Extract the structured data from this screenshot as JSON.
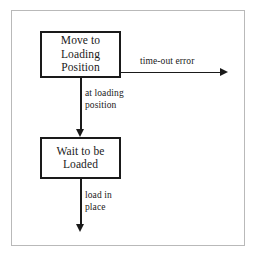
{
  "diagram": {
    "background_color": "#ffffff",
    "frame_color": "#b9b9b9",
    "stroke_color": "#1a1a1a",
    "nodes": [
      {
        "id": "move-to-loading-position",
        "label": "Move to\nLoading\nPosition"
      },
      {
        "id": "wait-to-be-loaded",
        "label": "Wait to be\nLoaded"
      }
    ],
    "edges": [
      {
        "id": "timeout-error",
        "label": "time-out error",
        "from": "move-to-loading-position",
        "to": "",
        "direction": "right"
      },
      {
        "id": "at-loading-position",
        "label": "at loading\nposition",
        "from": "move-to-loading-position",
        "to": "wait-to-be-loaded",
        "direction": "down"
      },
      {
        "id": "load-in-place",
        "label": "load in\nplace",
        "from": "wait-to-be-loaded",
        "to": "",
        "direction": "down"
      }
    ]
  }
}
